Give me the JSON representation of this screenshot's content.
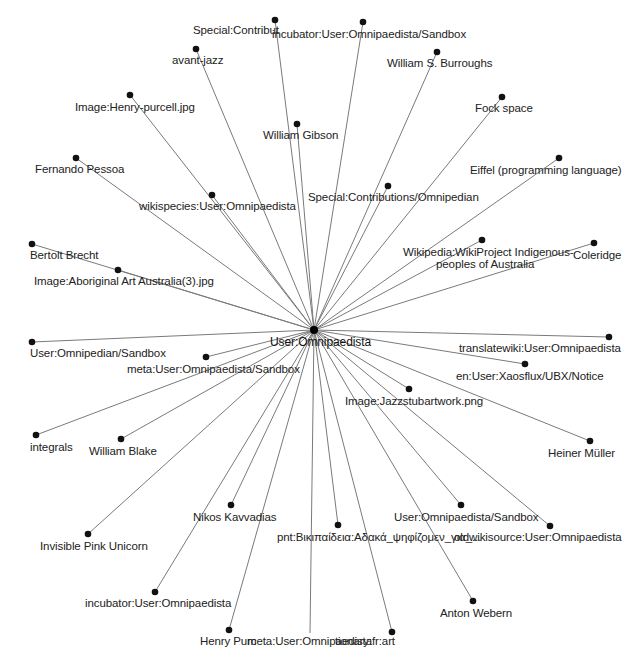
{
  "graph": {
    "hub": {
      "label": "User:Omnipaedista",
      "x": 314,
      "y": 330,
      "lx": 270,
      "ly": 336
    },
    "edge_color": "#7a7a7a",
    "node_color": "#111111",
    "nodes": [
      {
        "label": "Special:Contribut",
        "x": 275,
        "y": 20,
        "lx": 193,
        "ly": 24
      },
      {
        "label": "incubator:User:Omnipaedista/Sandbox",
        "x": 363,
        "y": 22,
        "lx": 272,
        "ly": 28
      },
      {
        "label": "avant-jazz",
        "x": 196,
        "y": 49,
        "lx": 172,
        "ly": 54
      },
      {
        "label": "William S. Burroughs",
        "x": 437,
        "y": 52,
        "lx": 387,
        "ly": 57
      },
      {
        "label": "Image:Henry-purcell.jpg",
        "x": 130,
        "y": 95,
        "lx": 75,
        "ly": 101
      },
      {
        "label": "Fock space",
        "x": 502,
        "y": 97,
        "lx": 475,
        "ly": 102
      },
      {
        "label": "William Gibson",
        "x": 297,
        "y": 124,
        "lx": 263,
        "ly": 129
      },
      {
        "label": "Fernando Pessoa",
        "x": 76,
        "y": 158,
        "lx": 35,
        "ly": 163
      },
      {
        "label": "Eiffel (programming language)",
        "x": 559,
        "y": 158,
        "lx": 470,
        "ly": 164
      },
      {
        "label": "Special:Contributions/Omnipedian",
        "x": 388,
        "y": 186,
        "lx": 308,
        "ly": 191
      },
      {
        "label": "wikispecies:User:Omnipaedista",
        "x": 212,
        "y": 195,
        "lx": 139,
        "ly": 200
      },
      {
        "label": "Bertolt Brecht",
        "x": 32,
        "y": 244,
        "lx": 30,
        "ly": 249
      },
      {
        "label": "Wikipedia:WikiProject Indigenous-",
        "label2": "peoples of Australia",
        "x": 482,
        "y": 240,
        "lx": 403,
        "ly": 246,
        "lx2": 436,
        "ly2": 258
      },
      {
        "label": "Coleridge",
        "x": 594,
        "y": 243,
        "lx": 573,
        "ly": 249
      },
      {
        "label": "Image:Aboriginal Art Australia(3).jpg",
        "x": 118,
        "y": 270,
        "lx": 34,
        "ly": 275
      },
      {
        "label": "User:Omnipedian/Sandbox",
        "x": 32,
        "y": 342,
        "lx": 30,
        "ly": 347
      },
      {
        "label": "meta:User:Omnipaedista/Sandbox",
        "x": 206,
        "y": 357,
        "lx": 127,
        "ly": 363
      },
      {
        "label": "translatewiki:User:Omnipaedista",
        "x": 609,
        "y": 337,
        "lx": 459,
        "ly": 342
      },
      {
        "label": "en:User:Xaosflux/UBX/Notice",
        "x": 525,
        "y": 364,
        "lx": 456,
        "ly": 370
      },
      {
        "label": "Image:Jazzstubartwork.png",
        "x": 409,
        "y": 389,
        "lx": 345,
        "ly": 395
      },
      {
        "label": "integrals",
        "x": 36,
        "y": 435,
        "lx": 30,
        "ly": 441
      },
      {
        "label": "William Blake",
        "x": 121,
        "y": 439,
        "lx": 89,
        "ly": 445
      },
      {
        "label": "Heiner Müller",
        "x": 590,
        "y": 441,
        "lx": 548,
        "ly": 447
      },
      {
        "label": "Nikos Kavvadias",
        "x": 231,
        "y": 505,
        "lx": 193,
        "ly": 511
      },
      {
        "label": "User:Omnipaedista/Sandbox",
        "x": 461,
        "y": 505,
        "lx": 394,
        "ly": 511
      },
      {
        "label": "oldwikisource:User:Omnipaedista",
        "x": 550,
        "y": 526,
        "lx": 454,
        "ly": 531
      },
      {
        "label": "pnt:Βικιπαίδεια:Αδακά_ψηφίζομεν_για_...",
        "x": 338,
        "y": 525,
        "lx": 277,
        "ly": 531
      },
      {
        "label": "Invisible Pink Unicorn",
        "x": 88,
        "y": 534,
        "lx": 40,
        "ly": 540
      },
      {
        "label": "incubator:User:Omnipaedista",
        "x": 155,
        "y": 592,
        "lx": 85,
        "ly": 597
      },
      {
        "label": "Anton Webern",
        "x": 473,
        "y": 601,
        "lx": 440,
        "ly": 607
      },
      {
        "label": "Henry Purc",
        "x": 229,
        "y": 630,
        "lx": 200,
        "ly": 635
      },
      {
        "label": "meta:User:Omnipaedista",
        "x": 310,
        "y": 633,
        "lx": 247,
        "ly": 635,
        "nodot": true
      },
      {
        "label": "tionary:fr:art",
        "x": 392,
        "y": 632,
        "lx": 335,
        "ly": 635
      }
    ]
  }
}
